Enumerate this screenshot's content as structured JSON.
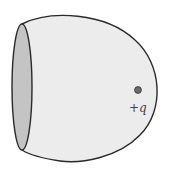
{
  "diagram": {
    "charge": {
      "label": "+q",
      "color": "#666666"
    },
    "colors": {
      "surface_fill": "#ececec",
      "opening_fill": "#c4c4c4",
      "outline": "#2a2a2a"
    }
  }
}
